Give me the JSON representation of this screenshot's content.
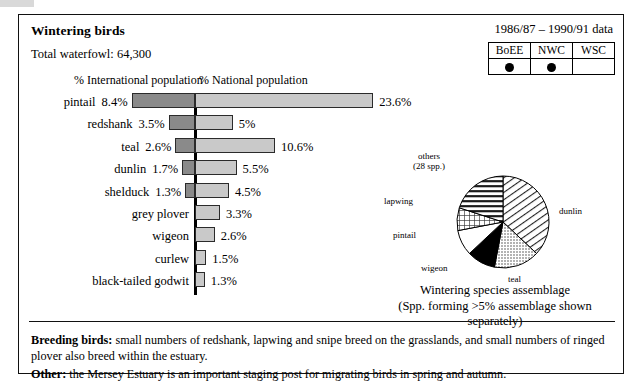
{
  "header": {
    "title": "Wintering birds",
    "total_waterfowl": "Total waterfowl: 64,300",
    "data_years": "1986/87 – 1990/91 data"
  },
  "designation_table": {
    "columns": [
      "BoEE",
      "NWC",
      "WSC"
    ],
    "marks": [
      true,
      true,
      false
    ]
  },
  "bar_chart_headers": {
    "international": "% International population",
    "national": "% National population"
  },
  "chart_data": {
    "type": "bar",
    "xlabel": "",
    "ylabel": "",
    "orientation": "horizontal-diverging",
    "categories": [
      "pintail",
      "redshank",
      "teal",
      "dunlin",
      "shelduck",
      "grey plover",
      "wigeon",
      "curlew",
      "black-tailed godwit"
    ],
    "series": [
      {
        "name": "% International population",
        "values": [
          8.4,
          3.5,
          2.6,
          1.7,
          1.3,
          null,
          null,
          null,
          null
        ],
        "labels": [
          "8.4%",
          "3.5%",
          "2.6%",
          "1.7%",
          "1.3%",
          "",
          "",
          "",
          ""
        ],
        "color": "#8a8a8a",
        "side": "left"
      },
      {
        "name": "% National population",
        "values": [
          23.6,
          5.0,
          10.6,
          5.5,
          4.5,
          3.3,
          2.6,
          1.5,
          1.3
        ],
        "labels": [
          "23.6%",
          "5%",
          "10.6%",
          "5.5%",
          "4.5%",
          "3.3%",
          "2.6%",
          "1.5%",
          "1.3%"
        ],
        "color": "#c9c9c9",
        "side": "right"
      }
    ],
    "grid": false,
    "legend": "none"
  },
  "pie_chart": {
    "type": "pie",
    "title": "Wintering species assemblage",
    "subtitle": "(Spp. forming >5% assemblage shown separately)",
    "slices": [
      {
        "label": "dunlin",
        "value": 37,
        "fill": "diagonal-hatch"
      },
      {
        "label": "teal",
        "value": 16,
        "fill": "light-dots"
      },
      {
        "label": "wigeon",
        "value": 10,
        "fill": "solid-black"
      },
      {
        "label": "pintail",
        "value": 9,
        "fill": "white"
      },
      {
        "label": "lapwing",
        "value": 8,
        "fill": "cross-hatch"
      },
      {
        "label": "others (28 spp.)",
        "value": 20,
        "fill": "horizontal-lines"
      }
    ],
    "others_label_line1": "others",
    "others_label_line2": "(28 spp.)"
  },
  "footer": {
    "breeding_label": "Breeding birds:",
    "breeding_text": " small numbers of redshank, lapwing and snipe breed on the grasslands, and small numbers of ringed plover also breed within the estuary.",
    "other_label": "Other:",
    "other_text": " the Mersey Estuary is an important staging post for migrating birds in spring and autumn."
  }
}
